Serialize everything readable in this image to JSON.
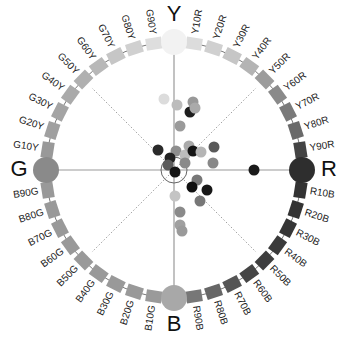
{
  "diagram": {
    "center": [
      174,
      170
    ],
    "ring_radius": 128,
    "inner_circle_radius": 13,
    "elementary_colours": [
      {
        "label": "Y",
        "angle": -90,
        "color": "#f2f2f2"
      },
      {
        "label": "R",
        "angle": 0,
        "color": "#2e2e2e"
      },
      {
        "label": "B",
        "angle": 90,
        "color": "#a8a8a8"
      },
      {
        "label": "G",
        "angle": 180,
        "color": "#8a8a8a"
      }
    ],
    "hue_steps": {
      "Y_to_R": [
        "Y10R",
        "Y20R",
        "Y30R",
        "Y40R",
        "Y50R",
        "Y60R",
        "Y70R",
        "Y80R",
        "Y90R"
      ],
      "R_to_B": [
        "R10B",
        "R20B",
        "R30B",
        "R40B",
        "R50B",
        "R60B",
        "R70B",
        "R80B",
        "R90B"
      ],
      "B_to_G": [
        "B10G",
        "B20G",
        "B30G",
        "B40G",
        "B50G",
        "B60G",
        "B70G",
        "B80G",
        "B90G"
      ],
      "G_to_Y": [
        "G10Y",
        "G20Y",
        "G30Y",
        "G40Y",
        "G50Y",
        "G60Y",
        "G70Y",
        "G80Y",
        "G90Y"
      ]
    },
    "step_colors": {
      "Y_to_R": [
        "#dcdcdc",
        "#d0d0d0",
        "#c6c6c6",
        "#b4b4b4",
        "#9c9c9c",
        "#8a8a8a",
        "#7a7a7a",
        "#6a6a6a",
        "#444444"
      ],
      "R_to_B": [
        "#333333",
        "#333333",
        "#363636",
        "#3a3a3a",
        "#3e3e3e",
        "#454545",
        "#555555",
        "#666666",
        "#777777"
      ],
      "B_to_G": [
        "#9a9a9a",
        "#999999",
        "#999999",
        "#999999",
        "#999999",
        "#999999",
        "#999999",
        "#999999",
        "#999999"
      ],
      "G_to_Y": [
        "#999999",
        "#a0a0a0",
        "#a4a4a4",
        "#aaaaaa",
        "#b0b0b0",
        "#b8b8b8",
        "#c6c6c6",
        "#d0d0d0",
        "#dedede"
      ]
    },
    "data_points": [
      {
        "x": 164,
        "y": 99,
        "c": "#dcdcdc"
      },
      {
        "x": 177,
        "y": 105,
        "c": "#bcbcbc"
      },
      {
        "x": 193,
        "y": 102,
        "c": "#999999"
      },
      {
        "x": 190,
        "y": 112,
        "c": "#1e1e1e"
      },
      {
        "x": 195,
        "y": 108,
        "c": "#aaaaaa"
      },
      {
        "x": 180,
        "y": 126,
        "c": "#9a9a9a"
      },
      {
        "x": 158,
        "y": 150,
        "c": "#2a2a2a"
      },
      {
        "x": 176,
        "y": 151,
        "c": "#8e8e8e"
      },
      {
        "x": 170,
        "y": 158,
        "c": "#222222"
      },
      {
        "x": 185,
        "y": 155,
        "c": "#bdbdbd"
      },
      {
        "x": 189,
        "y": 146,
        "c": "#aaaaaa"
      },
      {
        "x": 193,
        "y": 151,
        "c": "#151515"
      },
      {
        "x": 201,
        "y": 152,
        "c": "#b5b5b5"
      },
      {
        "x": 214,
        "y": 147,
        "c": "#5a5a5a"
      },
      {
        "x": 168,
        "y": 165,
        "c": "#5c5c5c"
      },
      {
        "x": 185,
        "y": 163,
        "c": "#8a8a8a"
      },
      {
        "x": 175,
        "y": 172,
        "c": "#151515"
      },
      {
        "x": 213,
        "y": 163,
        "c": "#888888"
      },
      {
        "x": 254,
        "y": 170,
        "c": "#1a1a1a"
      },
      {
        "x": 197,
        "y": 180,
        "c": "#777777"
      },
      {
        "x": 192,
        "y": 187,
        "c": "#101010"
      },
      {
        "x": 207,
        "y": 190,
        "c": "#181818"
      },
      {
        "x": 175,
        "y": 196,
        "c": "#c4c4c4"
      },
      {
        "x": 200,
        "y": 201,
        "c": "#777777"
      },
      {
        "x": 180,
        "y": 212,
        "c": "#8a8a8a"
      },
      {
        "x": 180,
        "y": 225,
        "c": "#a0a0a0"
      },
      {
        "x": 182,
        "y": 231,
        "c": "#9a9a9a"
      }
    ],
    "diagonal_guides": [
      45,
      135,
      225,
      315
    ]
  }
}
